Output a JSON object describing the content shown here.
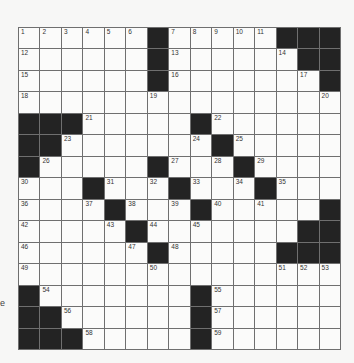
{
  "puzzle": {
    "type": "crossword",
    "size": {
      "rows": 15,
      "cols": 15
    },
    "colors": {
      "background": "#f7f7f6",
      "block": "#232323",
      "gridline": "#6f6f6f",
      "cell": "#fbfbfa"
    },
    "grid": [
      [
        "1",
        "2",
        "3",
        "4",
        "5",
        "6",
        "#",
        "7",
        "8",
        "9",
        "10",
        "11",
        "#",
        "#",
        "#"
      ],
      [
        "12",
        "",
        "",
        "",
        "",
        "",
        "#",
        "13",
        "",
        "",
        "",
        "",
        "14",
        "#",
        "#"
      ],
      [
        "15",
        "",
        "",
        "",
        "",
        "",
        "#",
        "16",
        "",
        "",
        "",
        "",
        "",
        "17",
        "#"
      ],
      [
        "18",
        "",
        "",
        "",
        "",
        "",
        "19",
        "",
        "",
        "",
        "",
        "",
        "",
        "",
        "20"
      ],
      [
        "#",
        "#",
        "#",
        "21",
        "",
        "",
        "",
        "",
        "#",
        "22",
        "",
        "",
        "",
        "",
        ""
      ],
      [
        "#",
        "#",
        "23",
        "",
        "",
        "",
        "",
        "",
        "24",
        "#",
        "25",
        "",
        "",
        "",
        ""
      ],
      [
        "#",
        "26",
        "",
        "",
        "",
        "",
        "#",
        "27",
        "",
        "28",
        "#",
        "29",
        "",
        "",
        ""
      ],
      [
        "30",
        "",
        "",
        "#",
        "31",
        "",
        "32",
        "#",
        "33",
        "",
        "34",
        "#",
        "35",
        "",
        ""
      ],
      [
        "36",
        "",
        "",
        "37",
        "#",
        "38",
        "",
        "39",
        "#",
        "40",
        "",
        "41",
        "",
        "",
        "#"
      ],
      [
        "42",
        "",
        "",
        "",
        "43",
        "#",
        "44",
        "",
        "45",
        "",
        "",
        "",
        "",
        "#",
        "#"
      ],
      [
        "46",
        "",
        "",
        "",
        "",
        "47",
        "#",
        "48",
        "",
        "",
        "",
        "",
        "#",
        "#",
        "#"
      ],
      [
        "49",
        "",
        "",
        "",
        "",
        "",
        "50",
        "",
        "",
        "",
        "",
        "",
        "51",
        "52",
        "53"
      ],
      [
        "#",
        "54",
        "",
        "",
        "",
        "",
        "",
        "",
        "#",
        "55",
        "",
        "",
        "",
        "",
        ""
      ],
      [
        "#",
        "#",
        "56",
        "",
        "",
        "",
        "",
        "",
        "#",
        "57",
        "",
        "",
        "",
        "",
        ""
      ],
      [
        "#",
        "#",
        "#",
        "58",
        "",
        "",
        "",
        "",
        "#",
        "59",
        "",
        "",
        "",
        "",
        ""
      ]
    ]
  },
  "margin": {
    "stray_text": "e"
  }
}
